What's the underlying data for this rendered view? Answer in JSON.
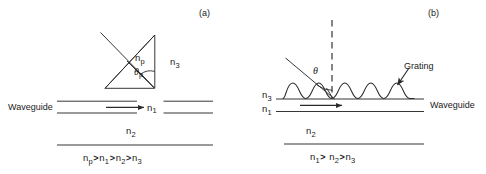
{
  "figure": {
    "stroke_color": "#2b2b2b",
    "background_color": "#ffffff"
  },
  "panels": [
    {
      "id": "a",
      "label": "(a)",
      "coupler_type": "prism",
      "labels": {
        "waveguide": "Waveguide",
        "prism_index": "n",
        "prism_index_sub": "p",
        "angle": "θ",
        "angle_sub": "p",
        "film_index": "n",
        "film_index_sub": "1",
        "substrate_index": "n",
        "substrate_index_sub": "2",
        "cover_index": "n",
        "cover_index_sub": "3"
      },
      "caption_terms": [
        "n_p",
        "n_1",
        "n_2",
        "n_3"
      ],
      "caption_text": "n p > n 1 > n 2 > n 3",
      "caption_parts": [
        {
          "base": "n",
          "sub": "p"
        },
        {
          "base": "n",
          "sub": "1"
        },
        {
          "base": "n",
          "sub": "2"
        },
        {
          "base": "n",
          "sub": "3"
        }
      ],
      "caption_operator": ">"
    },
    {
      "id": "b",
      "label": "(b)",
      "coupler_type": "grating",
      "labels": {
        "waveguide": "Waveguide",
        "grating": "Grating",
        "angle": "θ",
        "angle_sub": "",
        "film_index": "n",
        "film_index_sub": "1",
        "substrate_index": "n",
        "substrate_index_sub": "2",
        "cover_index": "n",
        "cover_index_sub": "3"
      },
      "grating_periods": 5,
      "caption_terms": [
        "n_1",
        "n_2",
        "n_3"
      ],
      "caption_text": "n 1 > n 2 > n 3",
      "caption_parts": [
        {
          "base": "n",
          "sub": "1"
        },
        {
          "base": "n",
          "sub": "2"
        },
        {
          "base": "n",
          "sub": "3"
        }
      ],
      "caption_operator": ">"
    }
  ]
}
